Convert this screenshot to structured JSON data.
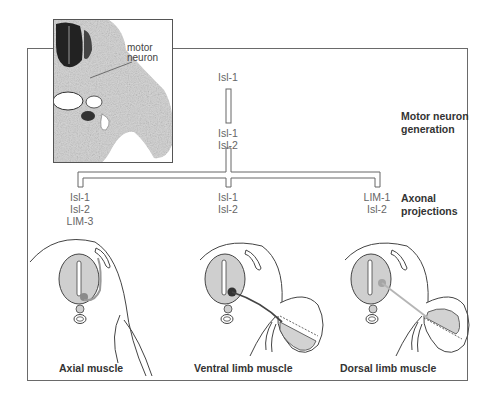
{
  "figure": {
    "photo_inset": {
      "label_line1": "motor",
      "label_line2": "neuron"
    },
    "stages": {
      "generation": {
        "line1": "Motor neuron",
        "line2": "generation"
      },
      "axonal": {
        "line1": "Axonal",
        "line2": "projections"
      }
    },
    "lineage": {
      "progenitor": {
        "genes": [
          "Isl-1"
        ]
      },
      "motor_neuron": {
        "genes": [
          "Isl-1",
          "Isl-2"
        ]
      },
      "branches": [
        {
          "id": "axial",
          "genes": [
            "Isl-1",
            "Isl-2",
            "LIM-3"
          ],
          "caption": "Axial muscle",
          "axon_color": "#9a9a9a",
          "soma_color": "#8a8a8a"
        },
        {
          "id": "ventral",
          "genes": [
            "Isl-1",
            "Isl-2"
          ],
          "caption": "Ventral limb muscle",
          "axon_color": "#444444",
          "soma_color": "#333333"
        },
        {
          "id": "dorsal",
          "genes": [
            "LIM-1",
            "Isl-2"
          ],
          "caption": "Dorsal limb muscle",
          "axon_color": "#b5b5b5",
          "soma_color": "#a5a5a5"
        }
      ]
    },
    "colors": {
      "neural_tube_fill": "#cfcfcf",
      "line": "#444444",
      "frame": "#6a6a6a",
      "muscle_fill": "#d2d2d2"
    }
  }
}
